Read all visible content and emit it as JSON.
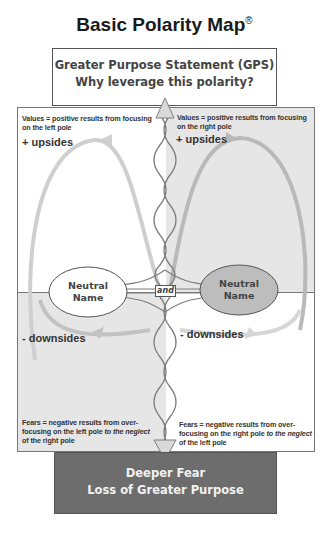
{
  "title": {
    "text": "Basic Polarity Map",
    "registered_mark": "®"
  },
  "gps": {
    "line1": "Greater Purpose Statement (GPS)",
    "line2": "Why leverage this polarity?"
  },
  "quadrants": {
    "top_left": {
      "values_line1": "Values = positive results from focusing",
      "values_line2": "on the left pole",
      "label": "+ upsides",
      "background": "#ffffff"
    },
    "top_right": {
      "values_line1": "Values = positive results from focusing",
      "values_line2": "on the right pole",
      "label": "+ upsides",
      "background": "#e6e6e6"
    },
    "bottom_left": {
      "label": "- downsides",
      "fears_line1": "Fears = negative results from over-",
      "fears_line2a": "focusing on the left pole ",
      "fears_line2b": "to the neglect",
      "fears_line3": "of the right pole",
      "background": "#e6e6e6"
    },
    "bottom_right": {
      "label": "- downsides",
      "fears_line1": "Fears = negative results from over-",
      "fears_line2a": "focusing on the right pole ",
      "fears_line2b": "to the neglect",
      "fears_line3": "of the left pole",
      "background": "#ffffff"
    }
  },
  "poles": {
    "left": {
      "line1": "Neutral",
      "line2": "Name",
      "fill": "#ffffff"
    },
    "right": {
      "line1": "Neutral",
      "line2": "Name",
      "fill": "#bdbdbd"
    },
    "connector": "and"
  },
  "deeper_fear": {
    "line1": "Deeper Fear",
    "line2": "Loss of Greater Purpose",
    "background": "#6d6d6d"
  },
  "colors": {
    "infinity_loop": "#c8c8c8",
    "helix": "#8a8a8a",
    "border": "#777777"
  }
}
